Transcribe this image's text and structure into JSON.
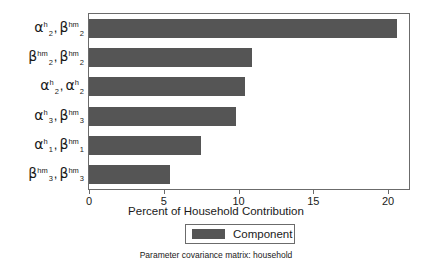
{
  "chart_data": {
    "type": "bar",
    "orientation": "horizontal",
    "title": "",
    "xlabel": "Percent of Household Contribution",
    "ylabel": "",
    "xlim": [
      0,
      21.4
    ],
    "xticks": [
      0,
      5,
      10,
      15,
      20
    ],
    "xticklabels": [
      "0",
      "5",
      "10",
      "15",
      "20"
    ],
    "grid": false,
    "categories": [
      "alpha^h_2 , beta^hm_2",
      "beta^hm_2 , beta^hm_2",
      "alpha^h_2 , alpha^h_2",
      "alpha^h_3 , beta^hm_3",
      "alpha^h_1 , beta^hm_1",
      "beta^hm_3 , beta^hm_3"
    ],
    "category_parts": [
      [
        {
          "base": "α",
          "sup": "h",
          "sub": "2"
        },
        {
          "base": "β",
          "sup": "hm",
          "sub": "2"
        }
      ],
      [
        {
          "base": "β",
          "sup": "hm",
          "sub": "2"
        },
        {
          "base": "β",
          "sup": "hm",
          "sub": "2"
        }
      ],
      [
        {
          "base": "α",
          "sup": "h",
          "sub": "2"
        },
        {
          "base": "α",
          "sup": "h",
          "sub": "2"
        }
      ],
      [
        {
          "base": "α",
          "sup": "h",
          "sub": "3"
        },
        {
          "base": "β",
          "sup": "hm",
          "sub": "3"
        }
      ],
      [
        {
          "base": "α",
          "sup": "h",
          "sub": "1"
        },
        {
          "base": "β",
          "sup": "hm",
          "sub": "1"
        }
      ],
      [
        {
          "base": "β",
          "sup": "hm",
          "sub": "3"
        },
        {
          "base": "β",
          "sup": "hm",
          "sub": "3"
        }
      ]
    ],
    "values": [
      20.6,
      10.9,
      10.4,
      9.8,
      7.5,
      5.4
    ],
    "series": [
      {
        "name": "Component",
        "color": "#555555",
        "values": [
          20.6,
          10.9,
          10.4,
          9.8,
          7.5,
          5.4
        ]
      }
    ],
    "legend": {
      "position": "bottom-center",
      "entries": [
        {
          "label": "Component",
          "color": "#555555"
        }
      ]
    },
    "caption": "Parameter covariance matrix: household",
    "colors": {
      "bar": "#555555",
      "frame": "#6b6b6b",
      "text": "#1a1a1a",
      "background": "#ffffff"
    }
  }
}
